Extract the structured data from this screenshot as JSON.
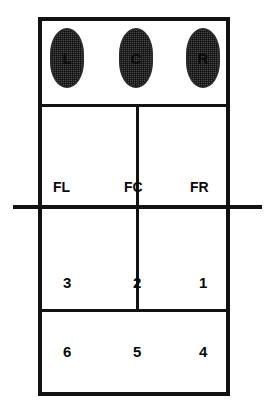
{
  "diagram": {
    "colors": {
      "line": "#121212",
      "oval_fill": "#4a4a4a",
      "oval_border": "#2a2a2a",
      "text": "#0a0a0a",
      "background": "#ffffff"
    },
    "bench": {
      "seats": [
        {
          "label": "L",
          "name": "left"
        },
        {
          "label": "C",
          "name": "center"
        },
        {
          "label": "R",
          "name": "right"
        }
      ]
    },
    "front_row_captions": [
      {
        "label": "FL"
      },
      {
        "label": "FC"
      },
      {
        "label": "FR"
      }
    ],
    "positions": {
      "front_row": [
        {
          "label": "3"
        },
        {
          "label": "2"
        },
        {
          "label": "1"
        }
      ],
      "back_row": [
        {
          "label": "6"
        },
        {
          "label": "5"
        },
        {
          "label": "4"
        }
      ]
    }
  }
}
